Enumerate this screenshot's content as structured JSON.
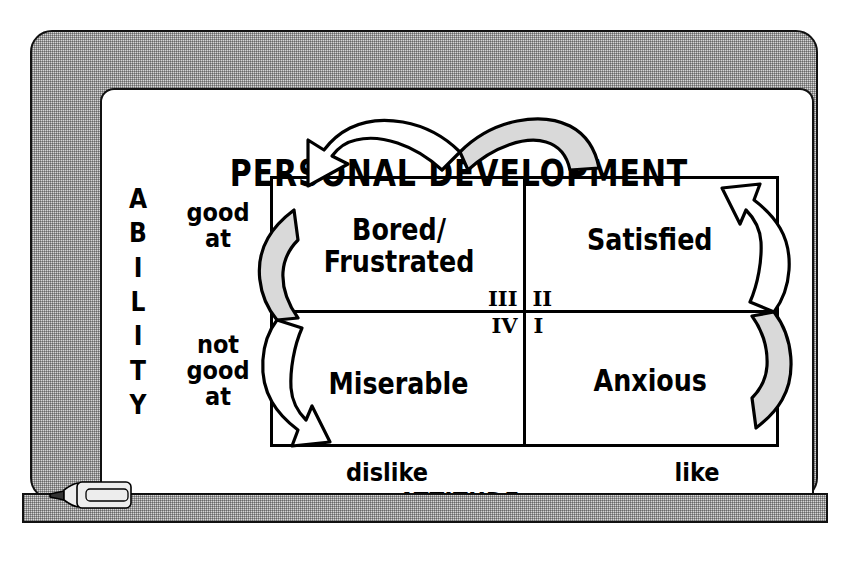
{
  "board": {
    "title": "PERSONAL DEVELOPMENT",
    "frame_color": "#d6d6d6",
    "surface_color": "#ffffff",
    "line_color": "#000000",
    "arrow_fill_color": "#d9d9d9"
  },
  "axes": {
    "y_axis_label": "A\nB\nI\nL\nI\nT\nY",
    "y_axis_name": "ABILITY",
    "y_ticks": [
      {
        "label": "good\nat",
        "position": "top"
      },
      {
        "label": "not\ngood\nat",
        "position": "bottom"
      }
    ],
    "x_axis_label": "ATTITUDE",
    "x_ticks": [
      {
        "label": "dislike",
        "position": "left"
      },
      {
        "label": "like",
        "position": "right"
      }
    ]
  },
  "matrix": {
    "quadrants": [
      {
        "id": "q3",
        "numeral": "III",
        "label": "Bored/\nFrustrated",
        "ability": "good at",
        "attitude": "dislike",
        "position": "top-left"
      },
      {
        "id": "q2",
        "numeral": "II",
        "label": "Satisfied",
        "ability": "good at",
        "attitude": "like",
        "position": "top-right"
      },
      {
        "id": "q4",
        "numeral": "IV",
        "label": "Miserable",
        "ability": "not good at",
        "attitude": "dislike",
        "position": "bottom-left"
      },
      {
        "id": "q1",
        "numeral": "I",
        "label": "Anxious",
        "ability": "not good at",
        "attitude": "like",
        "position": "bottom-right"
      }
    ]
  },
  "arrows": [
    {
      "id": "arrow-top",
      "name": "satisfied-to-bored-arrow",
      "direction": "right-to-left",
      "from": "Satisfied",
      "to": "Bored/Frustrated"
    },
    {
      "id": "arrow-left",
      "name": "bored-to-miserable-arrow",
      "direction": "top-to-bottom",
      "from": "Bored/Frustrated",
      "to": "Miserable"
    },
    {
      "id": "arrow-right",
      "name": "anxious-to-satisfied-arrow",
      "direction": "bottom-to-top",
      "from": "Anxious",
      "to": "Satisfied"
    }
  ],
  "accessories": {
    "marker_label": "whiteboard-marker",
    "tray_label": "marker-tray"
  }
}
